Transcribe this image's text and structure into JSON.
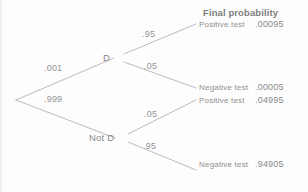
{
  "diagram": {
    "type": "probability-tree",
    "header": "Final probability",
    "root": {
      "name": "root-node",
      "x": 16,
      "y": 100
    },
    "nodes": [
      {
        "id": "d",
        "label": "D",
        "x": 114,
        "y": 58
      },
      {
        "id": "not-d",
        "label": "Not D",
        "x": 115,
        "y": 138
      }
    ],
    "branch_probabilities": [
      {
        "id": "p-d",
        "label": ".001",
        "x": 44,
        "y": 70
      },
      {
        "id": "p-not-d",
        "label": ".999",
        "x": 44,
        "y": 99
      },
      {
        "id": "p-pos-given-d",
        "label": ".95",
        "x": 142,
        "y": 34
      },
      {
        "id": "p-neg-given-d",
        "label": ".05",
        "x": 144,
        "y": 66
      },
      {
        "id": "p-pos-given-not-d",
        "label": ".05",
        "x": 144,
        "y": 114
      },
      {
        "id": "p-neg-given-not-d",
        "label": ".95",
        "x": 143,
        "y": 146
      }
    ],
    "outcomes": [
      {
        "id": "outcome-1",
        "label": "Positive test",
        "value": ".00095",
        "y": 25
      },
      {
        "id": "outcome-2",
        "label": "Negative test",
        "value": ".00005",
        "y": 88
      },
      {
        "id": "outcome-3",
        "label": "Positive test",
        "value": ".04995",
        "y": 101
      },
      {
        "id": "outcome-4",
        "label": "Negative test",
        "value": ".94905",
        "y": 165
      }
    ],
    "colors": {
      "line": "#b0b0b0",
      "text": "#8c8c8c",
      "background": "#fdfdfd"
    }
  }
}
